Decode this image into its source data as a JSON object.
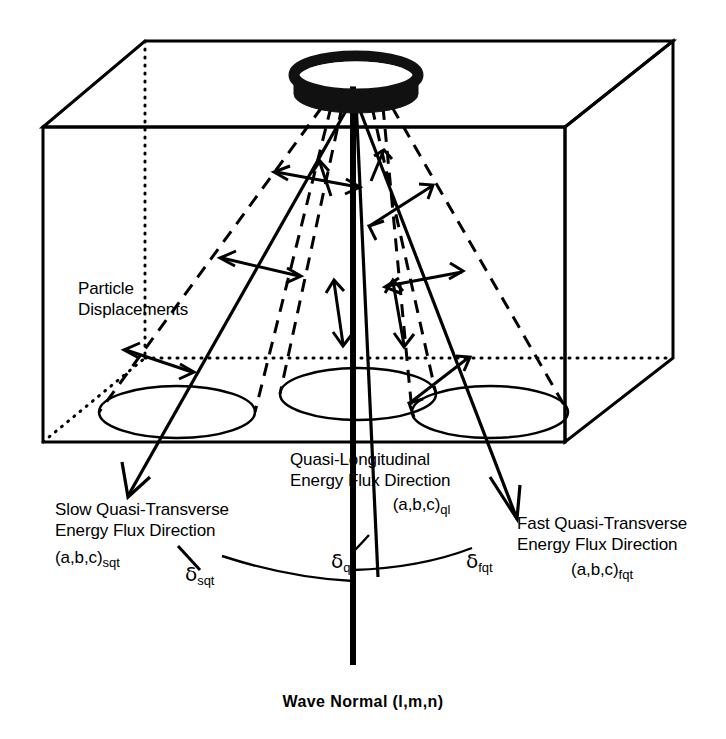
{
  "figure": {
    "title_label": "Wave Normal (l,m,n)",
    "particle_displacements_line1": "Particle",
    "particle_displacements_line2": "Displacements",
    "slow_qt": {
      "line1": "Slow Quasi-Transverse",
      "line2": "Energy Flux Direction",
      "vector": "(a,b,c)",
      "vector_sub": "sqt",
      "angle_symbol": "δ",
      "angle_sub": "sqt"
    },
    "quasi_longitudinal": {
      "line1": "Quasi-Longitudinal",
      "line2": "Energy Flux Direction",
      "vector": "(a,b,c)",
      "vector_sub": "ql",
      "angle_symbol": "δ",
      "angle_sub": "ql"
    },
    "fast_qt": {
      "line1": "Fast Quasi-Transverse",
      "line2": "Energy Flux Direction",
      "vector": "(a,b,c)",
      "vector_sub": "fqt",
      "angle_symbol": "δ",
      "angle_sub": "fqt"
    },
    "colors": {
      "ink": "#000000",
      "background": "#ffffff"
    }
  }
}
